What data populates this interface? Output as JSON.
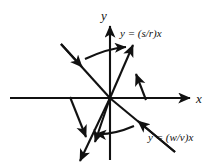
{
  "figure": {
    "type": "phase-portrait-diagram",
    "background_color": "#ffffff",
    "ink_color": "#111111",
    "axes": {
      "x_axis_label": "x",
      "y_axis_label": "y",
      "origin": {
        "x": 110,
        "y": 98
      },
      "x_axis_span": [
        10,
        196
      ],
      "y_axis_span": [
        22,
        160
      ]
    },
    "line_labels": [
      {
        "name": "eigenline-upper",
        "text": "y = (s/r)x",
        "x": 120,
        "y": 37
      },
      {
        "name": "eigenline-lower",
        "text": "y = (w/v)x",
        "x": 148,
        "y": 141
      }
    ],
    "trajectory_lines": [
      {
        "name": "line-unstable-steep",
        "description": "steep line through origin, arrows pointing outward away from origin",
        "direction": "outward"
      },
      {
        "name": "line-stable-shallow",
        "description": "shallow negative-slope line through origin, arrows pointing inward toward origin",
        "direction": "inward"
      }
    ]
  }
}
